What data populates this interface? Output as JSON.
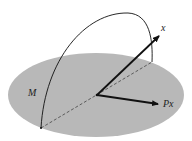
{
  "diagram": {
    "plane_label": "M",
    "vector_label": "x",
    "projection_label": "Px",
    "colors": {
      "plane": "#b8b8b8",
      "lines": "#111111",
      "background": "#ffffff"
    }
  }
}
